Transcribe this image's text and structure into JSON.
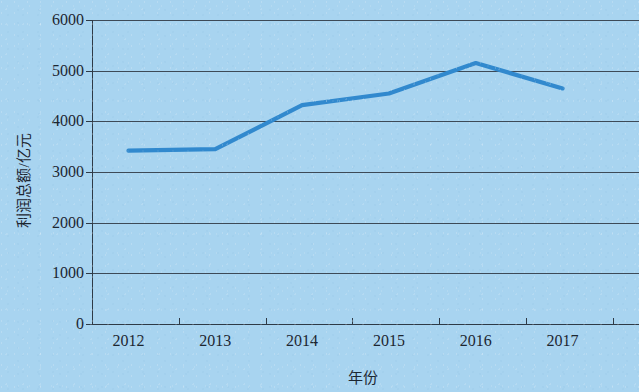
{
  "chart_data": {
    "type": "line",
    "title": "",
    "xlabel": "年份",
    "ylabel": "利润总额/亿元",
    "categories": [
      "2012",
      "2013",
      "2014",
      "2015",
      "2016",
      "2017"
    ],
    "values": [
      3420,
      3450,
      4320,
      4550,
      5150,
      4650
    ],
    "series": [
      {
        "name": "利润总额",
        "values": [
          3420,
          3450,
          4320,
          4550,
          5150,
          4650
        ],
        "color": "#3189ce"
      }
    ],
    "ylim": [
      0,
      6000
    ],
    "ytick_labels": [
      "6000",
      "5000",
      "4000",
      "3000",
      "2000",
      "1000",
      "0"
    ],
    "ytick_values": [
      6000,
      5000,
      4000,
      3000,
      2000,
      1000,
      0
    ],
    "grid": true,
    "grid_axis": "y",
    "legend": false,
    "markers": false,
    "background_color": "#a8d4f0",
    "grid_color": "#3d4a57",
    "axis_color": "#2e3a46",
    "text_color": "#1c2630"
  }
}
